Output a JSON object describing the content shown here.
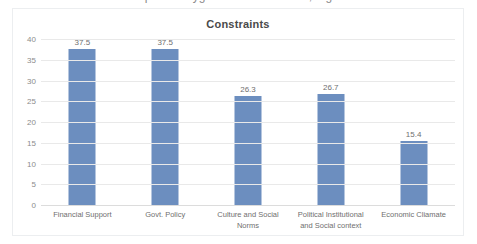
{
  "clipped_title_remnant": "Impact of Hygiene on Constraints, Fig. 3",
  "chart_data": {
    "type": "bar",
    "title": "Constraints",
    "xlabel": "",
    "ylabel": "",
    "categories": [
      "Financial Support",
      "Govt. Policy",
      "Culture and Social Norms",
      "Political Institutional and Social context",
      "Economic Cliamate"
    ],
    "values": [
      37.5,
      37.5,
      26.3,
      26.7,
      15.4
    ],
    "data_labels": [
      "37.5",
      "37.5",
      "26.3",
      "26.7",
      "15.4"
    ],
    "ylim": [
      0,
      40
    ],
    "ytick_labels": [
      "40",
      "35",
      "30",
      "25",
      "20",
      "15",
      "10",
      "5",
      "0"
    ],
    "ytick_values": [
      40,
      35,
      30,
      25,
      20,
      15,
      10,
      5,
      0
    ],
    "grid": true,
    "legend": false,
    "series_color": "#6C8EBF",
    "gridline_color": "#E9E9E9",
    "frame_color": "#ECEEF0",
    "text_color": "#6F6F6F"
  }
}
